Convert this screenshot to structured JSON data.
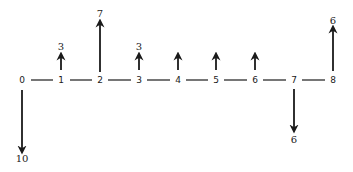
{
  "diagram": {
    "type": "cash-flow-diagram",
    "axis": {
      "periods": [
        "0",
        "1",
        "2",
        "3",
        "4",
        "5",
        "6",
        "7",
        "8"
      ]
    },
    "flows": [
      {
        "period": 0,
        "direction": "down",
        "label": "10"
      },
      {
        "period": 1,
        "direction": "up",
        "label": "3"
      },
      {
        "period": 2,
        "direction": "up",
        "label": "7"
      },
      {
        "period": 3,
        "direction": "up",
        "label": "3"
      },
      {
        "period": 4,
        "direction": "up",
        "label": ""
      },
      {
        "period": 5,
        "direction": "up",
        "label": ""
      },
      {
        "period": 6,
        "direction": "up",
        "label": ""
      },
      {
        "period": 7,
        "direction": "down",
        "label": "6"
      },
      {
        "period": 8,
        "direction": "up",
        "label": "6"
      }
    ]
  },
  "labels": {
    "p0": "0",
    "p1": "1",
    "p2": "2",
    "p3": "3",
    "p4": "4",
    "p5": "5",
    "p6": "6",
    "p7": "7",
    "p8": "8",
    "f0": "10",
    "f1": "3",
    "f2": "7",
    "f3": "3",
    "f7": "6",
    "f8": "6"
  }
}
